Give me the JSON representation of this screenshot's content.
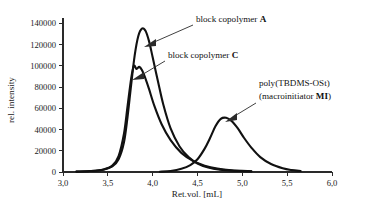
{
  "chart_data": {
    "type": "line",
    "title": "",
    "xlabel": "Ret.vol. [mL]",
    "ylabel": "rel. intensity",
    "xlim": [
      3.0,
      6.0
    ],
    "ylim": [
      0,
      145000
    ],
    "grid": false,
    "legend_position": "none",
    "x_ticks": [
      "3,0",
      "3,5",
      "4,0",
      "4,5",
      "5,0",
      "5,5",
      "6,0"
    ],
    "x_tick_values": [
      3.0,
      3.5,
      4.0,
      4.5,
      5.0,
      5.5,
      6.0
    ],
    "y_ticks": [
      "0",
      "20000",
      "40000",
      "60000",
      "80000",
      "100000",
      "120000",
      "140000"
    ],
    "y_tick_values": [
      0,
      20000,
      40000,
      60000,
      80000,
      100000,
      120000,
      140000
    ],
    "series": [
      {
        "name": "block copolymer A",
        "peak_x": 3.88,
        "peak_y": 135000,
        "x_start": 3.15,
        "x_end": 5.1,
        "x": [
          3.15,
          3.3,
          3.45,
          3.55,
          3.62,
          3.68,
          3.72,
          3.76,
          3.8,
          3.84,
          3.88,
          3.92,
          3.96,
          4.0,
          4.06,
          4.12,
          4.2,
          4.3,
          4.4,
          4.5,
          4.62,
          4.75,
          4.9,
          5.1
        ],
        "values": [
          400,
          900,
          2200,
          5200,
          12000,
          28000,
          52000,
          82000,
          110000,
          128000,
          135000,
          133000,
          123000,
          108000,
          85000,
          63000,
          41000,
          24000,
          14000,
          8000,
          4200,
          2200,
          1200,
          600
        ]
      },
      {
        "name": "block copolymer C",
        "peak_x": 3.8,
        "peak_y": 100000,
        "x_start": 3.15,
        "x_end": 5.1,
        "x": [
          3.15,
          3.3,
          3.45,
          3.55,
          3.62,
          3.68,
          3.72,
          3.76,
          3.79,
          3.82,
          3.85,
          3.88,
          3.92,
          3.96,
          4.02,
          4.1,
          4.2,
          4.32,
          4.45,
          4.58,
          4.72,
          4.88,
          5.1
        ],
        "values": [
          400,
          900,
          2400,
          6000,
          15000,
          36000,
          62000,
          88000,
          100000,
          97000,
          99000,
          96000,
          88000,
          78000,
          62000,
          45000,
          30000,
          18000,
          10500,
          6000,
          3200,
          1600,
          700
        ]
      },
      {
        "name": "poly(TBDMS-OSt) (macroinitiator MI)",
        "peak_x": 4.78,
        "peak_y": 51000,
        "x_start": 4.08,
        "x_end": 5.65,
        "x": [
          4.08,
          4.2,
          4.32,
          4.42,
          4.5,
          4.58,
          4.64,
          4.7,
          4.76,
          4.82,
          4.88,
          4.95,
          5.02,
          5.1,
          5.2,
          5.32,
          5.45,
          5.55,
          5.65
        ],
        "values": [
          300,
          1000,
          3000,
          6500,
          12000,
          22000,
          32000,
          43000,
          50000,
          51000,
          48000,
          41000,
          32000,
          23000,
          14000,
          7500,
          3500,
          1800,
          900
        ]
      }
    ],
    "annotations": [
      {
        "id": "annotation-copolymer-a",
        "text": "block copolymer ",
        "bold": "A",
        "target_x": 3.93,
        "target_y": 118000
      },
      {
        "id": "annotation-copolymer-c",
        "text": "block copolymer ",
        "bold": "C",
        "target_x": 3.87,
        "target_y": 88000
      },
      {
        "id": "annotation-macroinitiator",
        "line1": "poly(TBDMS-OSt)",
        "line2_prefix": "(macroinitiator ",
        "line2_bold": "MI",
        "line2_suffix": ")",
        "target_x": 4.88,
        "target_y": 45000
      }
    ]
  },
  "colors": {
    "curve": "#111111",
    "axis": "#2a2a2a",
    "text": "#1a1a1a",
    "background": "#ffffff"
  }
}
